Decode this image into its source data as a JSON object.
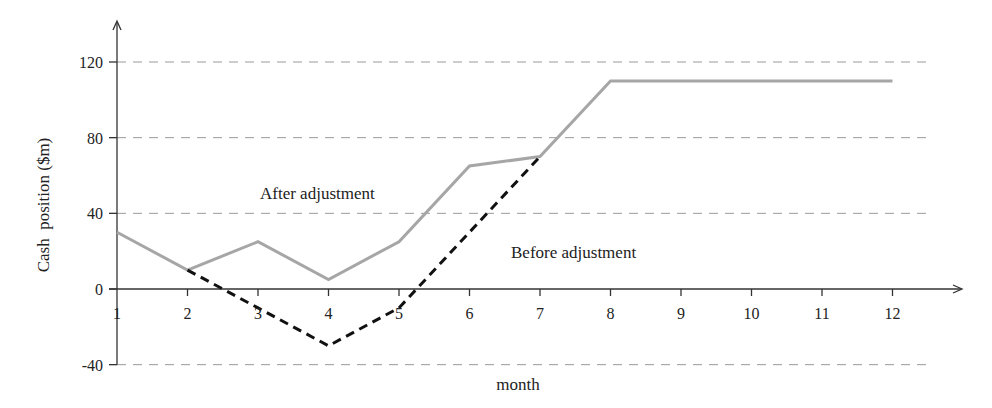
{
  "chart_data": {
    "type": "line",
    "title": "",
    "xlabel": "month",
    "ylabel": "Cash  position ($m)",
    "x": [
      1,
      2,
      3,
      4,
      5,
      6,
      7,
      8,
      9,
      10,
      11,
      12
    ],
    "x_tick_labels": [
      "1",
      "2",
      "3",
      "4",
      "5",
      "6",
      "7",
      "8",
      "9",
      "10",
      "11",
      "12"
    ],
    "y_ticks": [
      -40,
      0,
      40,
      80,
      120
    ],
    "y_tick_labels": [
      "-40",
      "0",
      "40",
      "80",
      "120"
    ],
    "ylim": [
      -40,
      130
    ],
    "grid": {
      "horizontal": true,
      "style": "dashed",
      "lines_at": [
        -40,
        40,
        80,
        120
      ]
    },
    "legend": "none (inline annotations)",
    "series": [
      {
        "name": "After adjustment",
        "style": "solid",
        "color": "#a6a6a6",
        "x": [
          1,
          2,
          3,
          4,
          5,
          6,
          7,
          8,
          9,
          10,
          11,
          12
        ],
        "values": [
          30,
          10,
          25,
          5,
          25,
          65,
          70,
          110,
          110,
          110,
          110,
          110
        ]
      },
      {
        "name": "Before adjustment",
        "style": "dashed",
        "color": "#111111",
        "x": [
          2,
          3,
          4,
          5,
          6,
          7
        ],
        "values": [
          10,
          -10,
          -30,
          -10,
          30,
          70
        ]
      }
    ],
    "annotations": [
      {
        "text": "After adjustment",
        "near_x": 3.9,
        "near_y": 50
      },
      {
        "text": "Before adjustment",
        "near_x": 7.9,
        "near_y": 19
      }
    ]
  },
  "labels": {
    "after": "After adjustment",
    "before": "Before adjustment",
    "xlabel": "month",
    "ylabel": "Cash  position ($m)"
  },
  "colors": {
    "after_line": "#a6a6a6",
    "before_line": "#111111",
    "grid": "#9a9a9a",
    "axis": "#333333"
  }
}
